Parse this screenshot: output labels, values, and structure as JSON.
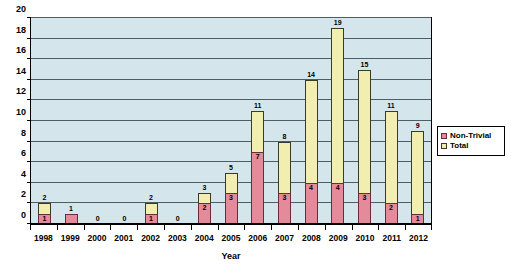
{
  "chart_data": {
    "type": "bar",
    "title": "",
    "xlabel": "Year",
    "ylabel": "",
    "ylim": [
      0,
      20
    ],
    "ytick_step": 2,
    "yticks": [
      0,
      2,
      4,
      6,
      8,
      10,
      12,
      14,
      16,
      18,
      20
    ],
    "grid": true,
    "legend_position": "right",
    "categories": [
      "1998",
      "1999",
      "2000",
      "2001",
      "2002",
      "2003",
      "2004",
      "2005",
      "2006",
      "2007",
      "2008",
      "2009",
      "2010",
      "2011",
      "2012"
    ],
    "series": [
      {
        "name": "Non-Trivial",
        "color": "#e48a9b",
        "values": [
          1,
          1,
          0,
          0,
          1,
          0,
          2,
          3,
          7,
          3,
          4,
          4,
          3,
          2,
          1
        ]
      },
      {
        "name": "Total",
        "color": "#f2eeb0",
        "values": [
          2,
          1,
          0,
          0,
          2,
          0,
          3,
          5,
          11,
          8,
          14,
          19,
          15,
          11,
          9
        ]
      }
    ],
    "plot_background": "#d5e5ec",
    "figure_background": "#ffffff",
    "gridline_color": "#4e5c66"
  },
  "legend": {
    "items": [
      {
        "label": "Non-Trivial",
        "swatch": "nontrivial"
      },
      {
        "label": "Total",
        "swatch": "total"
      }
    ]
  }
}
